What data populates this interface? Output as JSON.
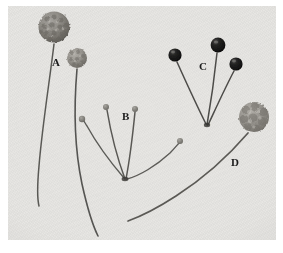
{
  "figure": {
    "type": "photographic-plate",
    "background_color": "#e7e6e3",
    "plate_border_color": "#ffffff",
    "ink_color": "#1b1b1b"
  },
  "labels": [
    {
      "id": "A",
      "text": "A",
      "x": 44,
      "y": 51
    },
    {
      "id": "B",
      "text": "B",
      "x": 114,
      "y": 105
    },
    {
      "id": "C",
      "text": "C",
      "x": 191,
      "y": 55
    },
    {
      "id": "D",
      "text": "D",
      "x": 223,
      "y": 151
    }
  ],
  "specimens": {
    "A": {
      "label": "A",
      "head_count": 2,
      "head_type": "granular-rough-sphere",
      "head_tone": "#8d8a85",
      "stalk_tone": "#54534f",
      "heads": [
        {
          "cx": 46,
          "cy": 21,
          "r": 16,
          "texture": "coarse-granular"
        },
        {
          "cx": 69,
          "cy": 52,
          "r": 10,
          "texture": "fine-granular"
        }
      ]
    },
    "B": {
      "label": "B",
      "head_count": 4,
      "head_type": "small-pale-knob",
      "head_tone": "#78766f",
      "stalk_tone": "#4a4946",
      "origin": {
        "x": 116,
        "y": 172
      },
      "heads": [
        {
          "cx": 74,
          "cy": 113,
          "r": 3
        },
        {
          "cx": 98,
          "cy": 100,
          "r": 3
        },
        {
          "cx": 127,
          "cy": 102,
          "r": 3
        },
        {
          "cx": 172,
          "cy": 135,
          "r": 3
        }
      ]
    },
    "C": {
      "label": "C",
      "head_count": 3,
      "head_type": "dark-glossy-sphere",
      "head_tone": "#191918",
      "stalk_tone": "#3f3e3b",
      "origin": {
        "x": 198,
        "y": 118
      },
      "heads": [
        {
          "cx": 167,
          "cy": 48,
          "r": 7
        },
        {
          "cx": 210,
          "cy": 38,
          "r": 8
        },
        {
          "cx": 227,
          "cy": 58,
          "r": 7
        }
      ]
    },
    "D": {
      "label": "D",
      "head_count": 1,
      "head_type": "lobed-cluster",
      "head_tone": "#8f8c87",
      "stalk_tone": "#4e4d49",
      "heads": [
        {
          "cx": 246,
          "cy": 111,
          "r": 16,
          "texture": "lobed-cluster"
        }
      ]
    }
  }
}
